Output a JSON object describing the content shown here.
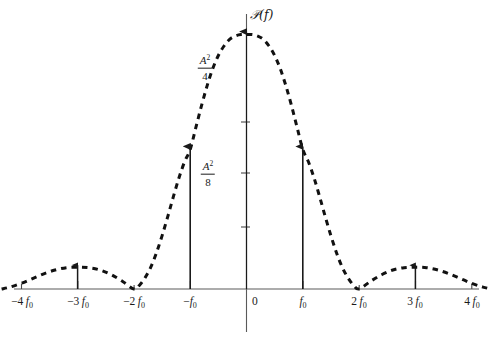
{
  "figure": {
    "background_color": "#ffffff",
    "ink_color": "#1a1a1a",
    "width": 493,
    "height": 339
  },
  "axes": {
    "y_axis_title": "𝒫(f)",
    "y_axis_title_plain": "P(f)",
    "x_axis_title": "",
    "origin_label": "0",
    "y_tick_labels": [
      {
        "text_num": "A",
        "text_sup": "2",
        "text_den": "4",
        "plain": "A^2/4",
        "value": 0.25
      },
      {
        "text_num": "A",
        "text_sup": "2",
        "text_den": "8",
        "plain": "A^2/8",
        "value": 0.125
      }
    ],
    "x_tick_labels": [
      {
        "sign": "−",
        "coef": "4",
        "sym": "f",
        "sub": "0",
        "plain": "-4f0",
        "value": -4
      },
      {
        "sign": "−",
        "coef": "3",
        "sym": "f",
        "sub": "0",
        "plain": "-3f0",
        "value": -3
      },
      {
        "sign": "−",
        "coef": "2",
        "sym": "f",
        "sub": "0",
        "plain": "-2f0",
        "value": -2
      },
      {
        "sign": "−",
        "coef": "",
        "sym": "f",
        "sub": "0",
        "plain": "-f0",
        "value": -1
      },
      {
        "sign": "",
        "coef": "",
        "sym": "",
        "sub": "",
        "plain": "0",
        "value": 0
      },
      {
        "sign": "",
        "coef": "",
        "sym": "f",
        "sub": "0",
        "plain": "f0",
        "value": 1
      },
      {
        "sign": "",
        "coef": "2",
        "sym": "f",
        "sub": "0",
        "plain": "2f0",
        "value": 2
      },
      {
        "sign": "",
        "coef": "3",
        "sym": "f",
        "sub": "0",
        "plain": "3f0",
        "value": 3
      },
      {
        "sign": "",
        "coef": "4",
        "sym": "f",
        "sub": "0",
        "plain": "4f0",
        "value": 4
      }
    ]
  },
  "chart_data": {
    "type": "line",
    "title": "",
    "xlabel": "f",
    "ylabel": "P(f)",
    "xlim": [
      -4.35,
      4.35
    ],
    "ylim": [
      0,
      0.295
    ],
    "grid": false,
    "legend": null,
    "curve_style": "dashed",
    "series": [
      {
        "name": "continuous-spectrum",
        "style": "dashed",
        "x": [
          -4.35,
          -4.2,
          -4.0,
          -3.8,
          -3.6,
          -3.4,
          -3.2,
          -3.0,
          -2.8,
          -2.6,
          -2.4,
          -2.2,
          -2.0,
          -1.9,
          -1.8,
          -1.7,
          -1.6,
          -1.5,
          -1.4,
          -1.3,
          -1.2,
          -1.1,
          -1.0,
          -0.9,
          -0.8,
          -0.7,
          -0.6,
          -0.5,
          -0.4,
          -0.3,
          -0.2,
          -0.1,
          0.0,
          0.1,
          0.2,
          0.3,
          0.4,
          0.5,
          0.6,
          0.7,
          0.8,
          0.9,
          1.0,
          1.1,
          1.2,
          1.3,
          1.4,
          1.5,
          1.6,
          1.7,
          1.8,
          1.9,
          2.0,
          2.2,
          2.4,
          2.6,
          2.8,
          3.0,
          3.2,
          3.4,
          3.6,
          3.8,
          4.0,
          4.2,
          4.35
        ],
        "y": [
          0.0,
          0.002,
          0.006,
          0.011,
          0.016,
          0.02,
          0.0225,
          0.023,
          0.0225,
          0.02,
          0.015,
          0.008,
          0.0,
          0.004,
          0.012,
          0.023,
          0.038,
          0.056,
          0.076,
          0.097,
          0.117,
          0.134,
          0.147,
          0.17,
          0.193,
          0.214,
          0.232,
          0.246,
          0.256,
          0.263,
          0.2665,
          0.268,
          0.268,
          0.268,
          0.2665,
          0.263,
          0.256,
          0.246,
          0.232,
          0.214,
          0.193,
          0.17,
          0.147,
          0.134,
          0.117,
          0.097,
          0.076,
          0.056,
          0.038,
          0.023,
          0.012,
          0.004,
          0.0,
          0.008,
          0.015,
          0.02,
          0.0225,
          0.023,
          0.0225,
          0.02,
          0.016,
          0.011,
          0.006,
          0.002,
          0.0
        ]
      }
    ],
    "impulses": [
      {
        "name": "impulse-minus-f0",
        "x": -1,
        "y": 0.147,
        "label": ""
      },
      {
        "name": "impulse-zero",
        "x": 0,
        "y": 0.268,
        "label": ""
      },
      {
        "name": "impulse-plus-f0",
        "x": 1,
        "y": 0.147,
        "label": ""
      }
    ],
    "sidelobe_markers": [
      {
        "name": "sidelobe-arrow-minus-3f0",
        "x": -3,
        "y": 0.023
      },
      {
        "name": "sidelobe-arrow-plus-3f0",
        "x": 3,
        "y": 0.023
      }
    ]
  }
}
